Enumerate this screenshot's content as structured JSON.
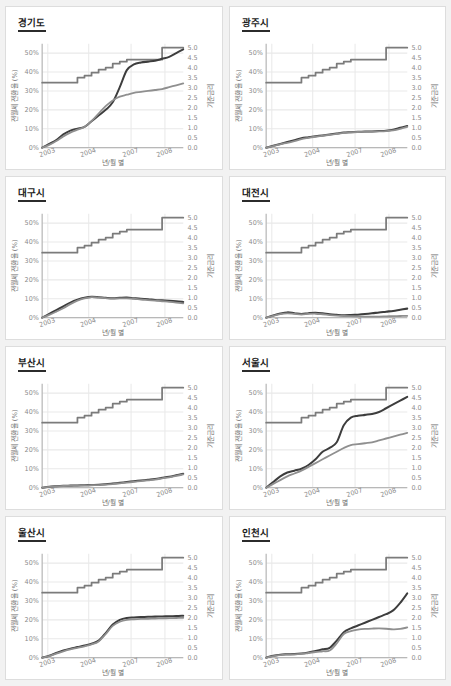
{
  "page": {
    "background": "#f2f2f2",
    "panel_background": "#ffffff",
    "panel_border": "#dddddd",
    "layout": "2 columns x 4 rows of small-multiple line charts"
  },
  "axis_common": {
    "left_label": "전월세 전환율 (%)",
    "right_label": "기준금리",
    "x_label": "년/월 별",
    "y_left_ticks": [
      "0%",
      "10%",
      "20%",
      "30%",
      "40%",
      "50%"
    ],
    "y_left_values": [
      0,
      10,
      20,
      30,
      40,
      50
    ],
    "y_right_ticks": [
      "0.0",
      "0.5",
      "1.0",
      "1.5",
      "2.0",
      "2.5",
      "3.0",
      "3.5",
      "4.0",
      "4.5",
      "5.0"
    ],
    "y_right_values": [
      0,
      0.5,
      1,
      1.5,
      2,
      2.5,
      3,
      3.5,
      4,
      4.5,
      5
    ],
    "x_ticks": [
      "2003",
      "2004",
      "2007",
      "2008"
    ],
    "x_tick_positions": [
      0.04,
      0.33,
      0.63,
      0.87
    ],
    "grid": true,
    "legend": "none"
  },
  "colors": {
    "series_step": "#7b7b7b",
    "series_a": "#3d3d3d",
    "series_b": "#8f8f8f",
    "gridline": "#e9e9e9",
    "axis": "#b8b8b8",
    "tick_text": "#8a8a8a",
    "title_text": "#1a1a1a",
    "title_rule": "#2b2b2b"
  },
  "chart_data": [
    {
      "type": "line",
      "title": "경기도",
      "xlabel": "년/월 별",
      "ylabel": "전월세 전환율 (%)",
      "ylabel_right": "기준금리",
      "ylim": [
        0,
        55
      ],
      "ylim_right": [
        0,
        5.2
      ],
      "x": [
        2003.0,
        2003.3,
        2003.6,
        2003.9,
        2004.2,
        2004.5,
        2004.8,
        2005.1,
        2005.4,
        2005.7,
        2006.0,
        2006.3,
        2006.6,
        2006.9,
        2007.2,
        2007.5,
        2007.8,
        2008.1,
        2008.4,
        2008.7,
        2009.0
      ],
      "series": [
        {
          "name": "기준금리 (step)",
          "axis": "right",
          "values": [
            3.25,
            3.25,
            3.25,
            3.25,
            3.25,
            3.5,
            3.6,
            3.75,
            3.9,
            4.0,
            4.2,
            4.3,
            4.4,
            4.4,
            4.4,
            4.4,
            4.4,
            5.0,
            5.0,
            5.0,
            5.0
          ]
        },
        {
          "name": "전환율 A",
          "axis": "left",
          "values": [
            0,
            2,
            4,
            7,
            9,
            10,
            11,
            14,
            17,
            20,
            24,
            32,
            41,
            44,
            45,
            45.5,
            46,
            47,
            48,
            50,
            52
          ]
        },
        {
          "name": "전환율 B",
          "axis": "left",
          "values": [
            0,
            1.5,
            3.5,
            6,
            8,
            9.5,
            11,
            14,
            18,
            22,
            25,
            27,
            28,
            29,
            29.5,
            30,
            30.5,
            31,
            32,
            33,
            34
          ]
        }
      ]
    },
    {
      "type": "line",
      "title": "광주시",
      "xlabel": "년/월 별",
      "ylabel": "전월세 전환율 (%)",
      "ylabel_right": "기준금리",
      "ylim": [
        0,
        55
      ],
      "ylim_right": [
        0,
        5.2
      ],
      "x": [
        2003.0,
        2003.3,
        2003.6,
        2003.9,
        2004.2,
        2004.5,
        2004.8,
        2005.1,
        2005.4,
        2005.7,
        2006.0,
        2006.3,
        2006.6,
        2006.9,
        2007.2,
        2007.5,
        2007.8,
        2008.1,
        2008.4,
        2008.7,
        2009.0
      ],
      "series": [
        {
          "name": "기준금리 (step)",
          "axis": "right",
          "values": [
            3.25,
            3.25,
            3.25,
            3.25,
            3.25,
            3.5,
            3.6,
            3.75,
            3.9,
            4.0,
            4.2,
            4.3,
            4.4,
            4.4,
            4.4,
            4.4,
            4.4,
            5.0,
            5.0,
            5.0,
            5.0
          ]
        },
        {
          "name": "전환율 A",
          "axis": "left",
          "values": [
            0,
            1,
            2,
            3,
            4,
            5,
            5.5,
            6,
            6.5,
            7,
            7.5,
            8,
            8.2,
            8.4,
            8.5,
            8.6,
            8.8,
            9,
            9.5,
            10.5,
            11.5
          ]
        },
        {
          "name": "전환율 B",
          "axis": "left",
          "values": [
            0,
            0.8,
            1.8,
            2.6,
            3.5,
            4.5,
            5.2,
            5.8,
            6.3,
            6.8,
            7.3,
            7.8,
            8.1,
            8.3,
            8.4,
            8.5,
            8.6,
            8.8,
            9.2,
            10,
            11
          ]
        }
      ]
    },
    {
      "type": "line",
      "title": "대구시",
      "xlabel": "년/월 별",
      "ylabel": "전월세 전환율 (%)",
      "ylabel_right": "기준금리",
      "ylim": [
        0,
        55
      ],
      "ylim_right": [
        0,
        5.2
      ],
      "x": [
        2003.0,
        2003.3,
        2003.6,
        2003.9,
        2004.2,
        2004.5,
        2004.8,
        2005.1,
        2005.4,
        2005.7,
        2006.0,
        2006.3,
        2006.6,
        2006.9,
        2007.2,
        2007.5,
        2007.8,
        2008.1,
        2008.4,
        2008.7,
        2009.0
      ],
      "series": [
        {
          "name": "기준금리 (step)",
          "axis": "right",
          "values": [
            3.25,
            3.25,
            3.25,
            3.25,
            3.25,
            3.5,
            3.6,
            3.75,
            3.9,
            4.0,
            4.2,
            4.3,
            4.4,
            4.4,
            4.4,
            4.4,
            4.4,
            5.0,
            5.0,
            5.0,
            5.0
          ]
        },
        {
          "name": "전환율 A",
          "axis": "left",
          "values": [
            0,
            2,
            4,
            6,
            8,
            9.5,
            10.5,
            11,
            10.8,
            10.5,
            10.3,
            10.5,
            10.6,
            10.3,
            10,
            9.8,
            9.4,
            9.2,
            9,
            8.7,
            8.3
          ]
        },
        {
          "name": "전환율 B",
          "axis": "left",
          "values": [
            0,
            1.5,
            3.2,
            5,
            7.2,
            9,
            10.2,
            10.9,
            10.6,
            10.3,
            10.1,
            10.2,
            10.2,
            10,
            9.6,
            9.3,
            9,
            8.7,
            8.4,
            8,
            7.6
          ]
        }
      ]
    },
    {
      "type": "line",
      "title": "대전시",
      "xlabel": "년/월 별",
      "ylabel": "전월세 전환율 (%)",
      "ylabel_right": "기준금리",
      "ylim": [
        0,
        55
      ],
      "ylim_right": [
        0,
        5.2
      ],
      "x": [
        2003.0,
        2003.3,
        2003.6,
        2003.9,
        2004.2,
        2004.5,
        2004.8,
        2005.1,
        2005.4,
        2005.7,
        2006.0,
        2006.3,
        2006.6,
        2006.9,
        2007.2,
        2007.5,
        2007.8,
        2008.1,
        2008.4,
        2008.7,
        2009.0
      ],
      "series": [
        {
          "name": "기준금리 (step)",
          "axis": "right",
          "values": [
            3.25,
            3.25,
            3.25,
            3.25,
            3.25,
            3.5,
            3.6,
            3.75,
            3.9,
            4.0,
            4.2,
            4.3,
            4.4,
            4.4,
            4.4,
            4.4,
            4.4,
            5.0,
            5.0,
            5.0,
            5.0
          ]
        },
        {
          "name": "전환율 A",
          "axis": "left",
          "values": [
            0,
            1.2,
            2.2,
            2.8,
            2.4,
            2.0,
            2.4,
            2.6,
            2.3,
            1.8,
            1.5,
            1.3,
            1.4,
            1.6,
            1.9,
            2.3,
            2.8,
            3.2,
            3.6,
            4.2,
            4.8
          ]
        },
        {
          "name": "전환율 B",
          "axis": "left",
          "values": [
            0,
            1.0,
            1.9,
            2.3,
            2.0,
            1.7,
            2.0,
            2.1,
            1.8,
            1.4,
            1.1,
            0.9,
            0.8,
            0.7,
            0.6,
            0.6,
            0.6,
            0.7,
            0.8,
            0.9,
            1.0
          ]
        }
      ]
    },
    {
      "type": "line",
      "title": "부산시",
      "xlabel": "년/월 별",
      "ylabel": "전월세 전환율 (%)",
      "ylabel_right": "기준금리",
      "ylim": [
        0,
        55
      ],
      "ylim_right": [
        0,
        5.2
      ],
      "x": [
        2003.0,
        2003.3,
        2003.6,
        2003.9,
        2004.2,
        2004.5,
        2004.8,
        2005.1,
        2005.4,
        2005.7,
        2006.0,
        2006.3,
        2006.6,
        2006.9,
        2007.2,
        2007.5,
        2007.8,
        2008.1,
        2008.4,
        2008.7,
        2009.0
      ],
      "series": [
        {
          "name": "기준금리 (step)",
          "axis": "right",
          "values": [
            3.25,
            3.25,
            3.25,
            3.25,
            3.25,
            3.5,
            3.6,
            3.75,
            3.9,
            4.0,
            4.2,
            4.3,
            4.4,
            4.4,
            4.4,
            4.4,
            4.4,
            5.0,
            5.0,
            5.0,
            5.0
          ]
        },
        {
          "name": "전환율 A",
          "axis": "left",
          "values": [
            0,
            0.5,
            0.8,
            1.0,
            1.1,
            1.2,
            1.3,
            1.4,
            1.5,
            1.8,
            2.2,
            2.6,
            3.0,
            3.4,
            3.8,
            4.2,
            4.6,
            5.2,
            5.8,
            6.6,
            7.4
          ]
        },
        {
          "name": "전환율 B",
          "axis": "left",
          "values": [
            0,
            0.4,
            0.7,
            0.9,
            1.0,
            1.1,
            1.2,
            1.3,
            1.4,
            1.6,
            1.9,
            2.3,
            2.7,
            3.1,
            3.5,
            3.9,
            4.3,
            4.9,
            5.5,
            6.2,
            7.0
          ]
        }
      ]
    },
    {
      "type": "line",
      "title": "서울시",
      "xlabel": "년/월 별",
      "ylabel": "전월세 전환율 (%)",
      "ylabel_right": "기준금리",
      "ylim": [
        0,
        55
      ],
      "ylim_right": [
        0,
        5.2
      ],
      "x": [
        2003.0,
        2003.3,
        2003.6,
        2003.9,
        2004.2,
        2004.5,
        2004.8,
        2005.1,
        2005.4,
        2005.7,
        2006.0,
        2006.3,
        2006.6,
        2006.9,
        2007.2,
        2007.5,
        2007.8,
        2008.1,
        2008.4,
        2008.7,
        2009.0
      ],
      "series": [
        {
          "name": "기준금리 (step)",
          "axis": "right",
          "values": [
            3.25,
            3.25,
            3.25,
            3.25,
            3.25,
            3.5,
            3.6,
            3.75,
            3.9,
            4.0,
            4.2,
            4.3,
            4.4,
            4.4,
            4.4,
            4.4,
            4.4,
            5.0,
            5.0,
            5.0,
            5.0
          ]
        },
        {
          "name": "전환율 A",
          "axis": "left",
          "values": [
            0,
            3,
            6,
            8,
            9,
            10,
            12,
            15,
            19,
            21,
            24,
            33,
            37,
            38,
            38.5,
            39,
            40,
            42,
            44,
            46,
            48
          ]
        },
        {
          "name": "전환율 B",
          "axis": "left",
          "values": [
            0,
            2,
            4,
            6,
            7.5,
            9,
            11,
            13,
            15,
            17,
            19,
            21,
            22.5,
            23,
            23.5,
            24,
            25,
            26,
            27,
            28,
            29
          ]
        }
      ]
    },
    {
      "type": "line",
      "title": "울산시",
      "xlabel": "년/월 별",
      "ylabel": "전월세 전환율 (%)",
      "ylabel_right": "기준금리",
      "ylim": [
        0,
        55
      ],
      "ylim_right": [
        0,
        5.2
      ],
      "x": [
        2003.0,
        2003.3,
        2003.6,
        2003.9,
        2004.2,
        2004.5,
        2004.8,
        2005.1,
        2005.4,
        2005.7,
        2006.0,
        2006.3,
        2006.6,
        2006.9,
        2007.2,
        2007.5,
        2007.8,
        2008.1,
        2008.4,
        2008.7,
        2009.0
      ],
      "series": [
        {
          "name": "기준금리 (step)",
          "axis": "right",
          "values": [
            3.25,
            3.25,
            3.25,
            3.25,
            3.25,
            3.5,
            3.6,
            3.75,
            3.9,
            4.0,
            4.2,
            4.3,
            4.4,
            4.4,
            4.4,
            4.4,
            4.4,
            5.0,
            5.0,
            5.0,
            5.0
          ]
        },
        {
          "name": "전환율 A",
          "axis": "left",
          "values": [
            0,
            1,
            2.5,
            3.8,
            4.8,
            5.6,
            6.4,
            7.4,
            9.0,
            13,
            17.5,
            20,
            21,
            21.3,
            21.5,
            21.6,
            21.7,
            21.8,
            21.9,
            22,
            22.2
          ]
        },
        {
          "name": "전환율 B",
          "axis": "left",
          "values": [
            0,
            0.8,
            2.2,
            3.4,
            4.4,
            5.2,
            6.0,
            7.0,
            8.6,
            12.5,
            16.8,
            19,
            20,
            20.3,
            20.5,
            20.6,
            20.7,
            20.8,
            20.9,
            21,
            21.1
          ]
        }
      ]
    },
    {
      "type": "line",
      "title": "인천시",
      "xlabel": "년/월 별",
      "ylabel": "전월세 전환율 (%)",
      "ylabel_right": "기준금리",
      "ylim": [
        0,
        55
      ],
      "ylim_right": [
        0,
        5.2
      ],
      "x": [
        2003.0,
        2003.3,
        2003.6,
        2003.9,
        2004.2,
        2004.5,
        2004.8,
        2005.1,
        2005.4,
        2005.7,
        2006.0,
        2006.3,
        2006.6,
        2006.9,
        2007.2,
        2007.5,
        2007.8,
        2008.1,
        2008.4,
        2008.7,
        2009.0
      ],
      "series": [
        {
          "name": "기준금리 (step)",
          "axis": "right",
          "values": [
            3.25,
            3.25,
            3.25,
            3.25,
            3.25,
            3.5,
            3.6,
            3.75,
            3.9,
            4.0,
            4.2,
            4.3,
            4.4,
            4.4,
            4.4,
            4.4,
            4.4,
            5.0,
            5.0,
            5.0,
            5.0
          ]
        },
        {
          "name": "전환율 A",
          "axis": "left",
          "values": [
            0,
            1,
            1.6,
            1.8,
            1.9,
            2.2,
            2.8,
            3.6,
            4.4,
            5.2,
            9,
            13.5,
            15.5,
            17,
            18.5,
            20,
            21.5,
            23,
            25,
            29,
            34
          ]
        },
        {
          "name": "전환율 B",
          "axis": "left",
          "values": [
            0,
            0.8,
            1.4,
            1.6,
            1.7,
            2.0,
            2.5,
            3.0,
            3.4,
            3.8,
            7.5,
            12.5,
            14,
            14.8,
            15.2,
            15.4,
            15.5,
            15.3,
            15.0,
            15.2,
            16
          ]
        }
      ]
    }
  ]
}
